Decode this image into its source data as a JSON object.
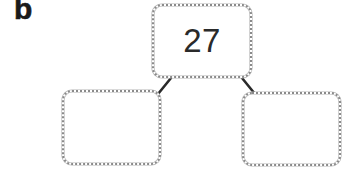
{
  "figure": {
    "label": "b"
  },
  "tree": {
    "root": {
      "value": "27"
    },
    "children": [
      {
        "position": "left",
        "value": ""
      },
      {
        "position": "right",
        "value": ""
      }
    ]
  },
  "colors": {
    "box_border": "#8a8a8a",
    "connector": "#2a2a2a",
    "text": "#2a2a2a",
    "label": "#1a1a1a"
  }
}
